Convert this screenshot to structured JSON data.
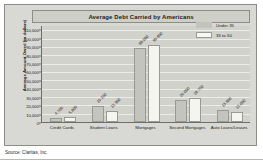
{
  "chart_data": {
    "type": "bar",
    "title": "Average Debt Carried by Americans",
    "xlabel": "",
    "ylabel": "Average Amount Owed (in dollars)",
    "ylim": [
      0,
      115000
    ],
    "grid": true,
    "legend_position": "top-right",
    "categories": [
      "Credit Cards",
      "Student Loans",
      "Mortgages",
      "Second Mortgages",
      "Auto Loans/Leases"
    ],
    "yticks": [
      0,
      10000,
      20000,
      30000,
      40000,
      50000,
      60000,
      70000,
      80000,
      90000,
      100000,
      110000
    ],
    "ytick_labels": [
      "0",
      "10,000",
      "20,000",
      "30,000",
      "40,000",
      "50,000",
      "60,000",
      "70,000",
      "80,000",
      "90,000",
      "100,000",
      "110,000"
    ],
    "series": [
      {
        "name": "Under 35",
        "values": [
          4700,
          19250,
          88000,
          26000,
          13800
        ],
        "labels": [
          "4,700",
          "19,250",
          "88,000",
          "26,000",
          "13,800"
        ],
        "color": "#c4c4bf"
      },
      {
        "name": "35 to 50",
        "values": [
          5800,
          12900,
          90800,
          28750,
          12000
        ],
        "labels": [
          "5,800",
          "12,900",
          "90,800",
          "28,750",
          "12,000"
        ],
        "color": "#f4f4f1"
      }
    ],
    "source": "Source: Claritas, Inc."
  },
  "legend": {
    "items": [
      {
        "label": "Under 35"
      },
      {
        "label": "35 to 50"
      }
    ]
  },
  "footer": {
    "source": "Source: Claritas, Inc."
  }
}
